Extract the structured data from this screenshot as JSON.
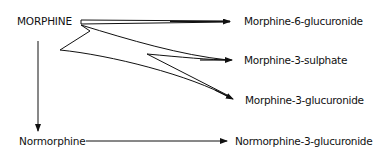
{
  "diagram": {
    "type": "metabolic-pathway",
    "source": {
      "label": "MORPHINE"
    },
    "products": [
      {
        "label": "Morphine-6-glucuronide"
      },
      {
        "label": "Morphine-3-sulphate"
      },
      {
        "label": "Morphine-3-glucuronide"
      }
    ],
    "intermediate": {
      "label": "Normorphine"
    },
    "intermediate_product": {
      "label": "Normorphine-3-glucuronide"
    },
    "edges": [
      {
        "from": "MORPHINE",
        "to": "Morphine-6-glucuronide"
      },
      {
        "from": "MORPHINE",
        "to": "Morphine-3-sulphate"
      },
      {
        "from": "MORPHINE",
        "to": "Morphine-3-glucuronide"
      },
      {
        "from": "MORPHINE",
        "to": "Normorphine"
      },
      {
        "from": "Normorphine",
        "to": "Normorphine-3-glucuronide"
      }
    ],
    "colors": {
      "stroke": "#111111",
      "background": "#ffffff"
    }
  }
}
